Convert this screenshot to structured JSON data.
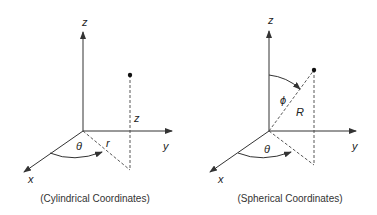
{
  "diagrams": [
    {
      "id": "cylindrical",
      "caption": "(Cylindrical Coordinates)",
      "axis_labels": {
        "x": "x",
        "y": "y",
        "z": "z"
      },
      "quantity_labels": {
        "theta": "θ",
        "r": "r",
        "z": "z"
      }
    },
    {
      "id": "spherical",
      "caption": "(Spherical Coordinates)",
      "axis_labels": {
        "x": "x",
        "y": "y",
        "z": "z"
      },
      "quantity_labels": {
        "theta": "θ",
        "phi": "ϕ",
        "R": "R"
      }
    }
  ]
}
